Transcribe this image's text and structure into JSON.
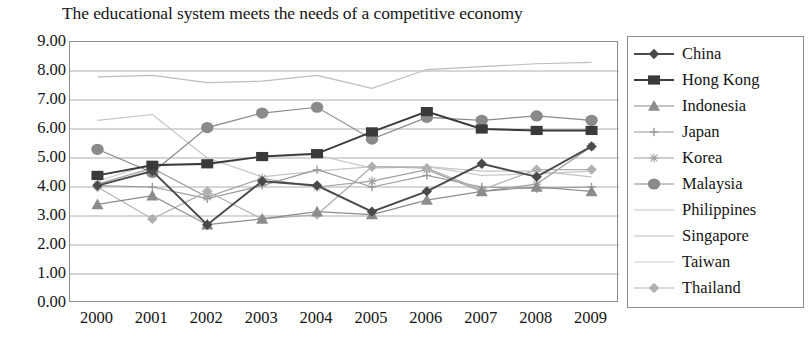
{
  "chart_data": {
    "type": "line",
    "title": "The educational system meets the needs of a competitive economy",
    "xlabel": "",
    "ylabel": "",
    "ylim": [
      0,
      9
    ],
    "ytick_step": 1,
    "ytick_format": "0.00",
    "grid": true,
    "legend_position": "right",
    "categories": [
      "2000",
      "2001",
      "2002",
      "2003",
      "2004",
      "2005",
      "2006",
      "2007",
      "2008",
      "2009"
    ],
    "yticks": [
      "9.00",
      "8.00",
      "7.00",
      "6.00",
      "5.00",
      "4.00",
      "3.00",
      "2.00",
      "1.00",
      "0.00"
    ],
    "series": [
      {
        "name": "China",
        "marker": "diamond",
        "color": "#4a4a4a",
        "values": [
          4.05,
          4.55,
          2.7,
          4.2,
          4.05,
          3.15,
          3.85,
          4.8,
          4.35,
          5.4
        ]
      },
      {
        "name": "Hong Kong",
        "marker": "square",
        "color": "#3a3a3a",
        "values": [
          4.4,
          4.75,
          4.8,
          5.05,
          5.15,
          5.9,
          6.6,
          6.0,
          5.95,
          5.95
        ]
      },
      {
        "name": "Indonesia",
        "marker": "triangle",
        "color": "#8c8c8c",
        "values": [
          3.4,
          3.7,
          2.7,
          2.9,
          3.15,
          3.05,
          3.55,
          3.85,
          4.0,
          3.85
        ]
      },
      {
        "name": "Japan",
        "marker": "cross",
        "color": "#9a9a9a",
        "values": [
          4.05,
          4.0,
          3.6,
          4.05,
          4.6,
          4.0,
          4.4,
          4.0,
          3.95,
          4.0
        ]
      },
      {
        "name": "Korea",
        "marker": "star",
        "color": "#a0a0a0",
        "values": [
          4.1,
          4.65,
          3.65,
          4.3,
          4.0,
          4.2,
          4.6,
          3.85,
          4.1,
          5.4
        ]
      },
      {
        "name": "Malaysia",
        "marker": "circle",
        "color": "#8a8a8a",
        "values": [
          5.3,
          4.5,
          6.05,
          6.55,
          6.75,
          5.65,
          6.4,
          6.3,
          6.45,
          6.3
        ]
      },
      {
        "name": "Philippines",
        "marker": "none",
        "color": "#c4c4c4",
        "values": [
          6.3,
          6.5,
          5.0,
          4.35,
          4.55,
          4.7,
          4.7,
          4.55,
          4.55,
          4.35
        ]
      },
      {
        "name": "Singapore",
        "marker": "none",
        "color": "#bdbdbd",
        "values": [
          7.8,
          7.85,
          7.6,
          7.65,
          7.85,
          7.4,
          8.05,
          8.15,
          8.25,
          8.3
        ]
      },
      {
        "name": "Taiwan",
        "marker": "none",
        "color": "#c9c9c9",
        "values": [
          4.2,
          4.8,
          4.75,
          5.05,
          5.1,
          4.65,
          4.7,
          4.4,
          4.45,
          4.55
        ]
      },
      {
        "name": "Thailand",
        "marker": "diamond-light",
        "color": "#b0b0b0",
        "values": [
          4.0,
          2.9,
          3.85,
          2.9,
          3.05,
          4.7,
          4.65,
          3.9,
          4.6,
          4.6
        ]
      }
    ]
  }
}
